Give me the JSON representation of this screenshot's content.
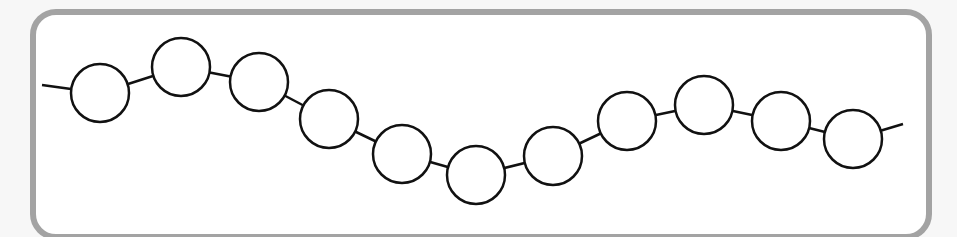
{
  "diagram": {
    "type": "bead-chain",
    "frame": {
      "border_color": "#a3a3a3",
      "background": "#ffffff"
    },
    "stroke_color": "#111111",
    "circle_radius": 29,
    "line_start": [
      42,
      85
    ],
    "line_end": [
      903,
      124
    ],
    "circles": [
      {
        "cx": 100,
        "cy": 93
      },
      {
        "cx": 181,
        "cy": 67
      },
      {
        "cx": 259,
        "cy": 82
      },
      {
        "cx": 329,
        "cy": 119
      },
      {
        "cx": 402,
        "cy": 154
      },
      {
        "cx": 476,
        "cy": 175
      },
      {
        "cx": 553,
        "cy": 156
      },
      {
        "cx": 627,
        "cy": 121
      },
      {
        "cx": 704,
        "cy": 105
      },
      {
        "cx": 781,
        "cy": 121
      },
      {
        "cx": 853,
        "cy": 139
      }
    ]
  }
}
